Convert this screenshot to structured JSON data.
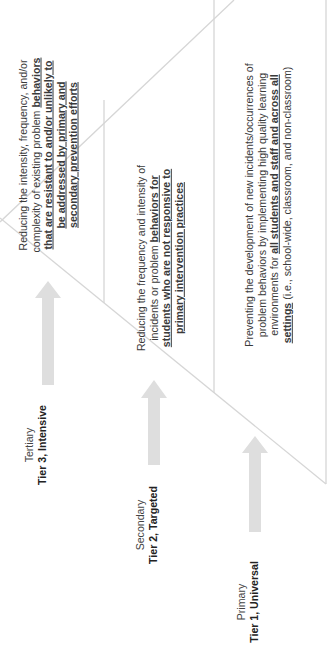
{
  "diagram": {
    "type": "tiered-pyramid",
    "orientation": "rotated-90-ccw",
    "colors": {
      "lines": "#d6d6d6",
      "arrows": "#dedede",
      "text": "#333333"
    },
    "tiers": [
      {
        "level": "Tertiary",
        "tier": "Tier 3, Intensive",
        "description": {
          "plain_1": "Reducing the intensity, frequency, and/or complexity of existing problem ",
          "emphasis": "behaviors that are resistant to and/or unlikely to be addressed by primary and secondary prevention efforts",
          "plain_2": ""
        }
      },
      {
        "level": "Secondary",
        "tier": "Tier 2, Targeted",
        "description": {
          "plain_1": "Reducing the frequency and intensity of incidents or problem ",
          "emphasis": "behaviors for students who are not responsive to primary intervention practices",
          "plain_2": ""
        }
      },
      {
        "level": "Primary",
        "tier": "Tier 1, Universal",
        "description": {
          "plain_1": "Preventing the development of new incidents/occurrences of problem behaviors by implementing high quality learning environments for ",
          "emphasis": "all students and staff and across all settings",
          "plain_2": " (i.e., school-wide, classroom, and non-classroom)"
        }
      }
    ]
  }
}
